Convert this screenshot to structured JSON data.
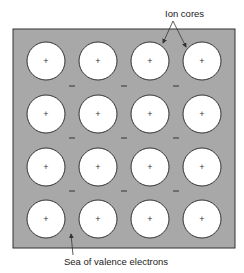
{
  "labels": {
    "ion_cores": "Ion cores",
    "sea": "Sea of valence electrons"
  },
  "ion_core_symbol": "+",
  "electron_symbol": "–",
  "grid": {
    "rows": 4,
    "cols": 4
  },
  "colors": {
    "sea": "#a8a8a8",
    "ion_core": "#ffffff",
    "stroke": "#333333"
  }
}
